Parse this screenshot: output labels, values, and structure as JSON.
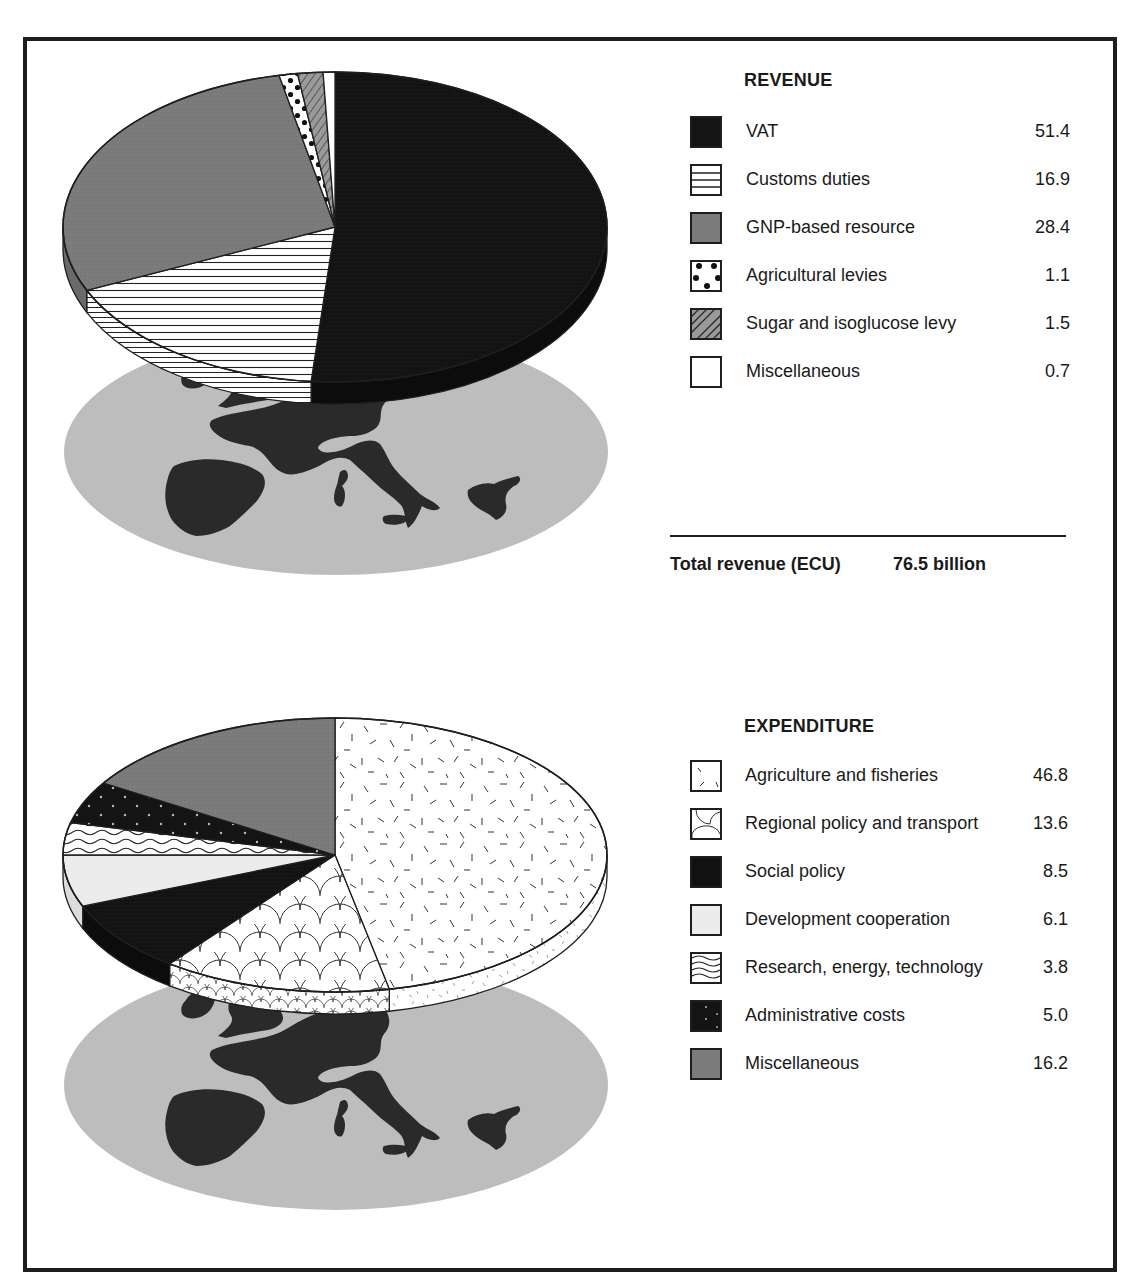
{
  "revenue": {
    "title": "REVENUE",
    "items": [
      {
        "label": "VAT",
        "value": "51.4"
      },
      {
        "label": "Customs duties",
        "value": "16.9"
      },
      {
        "label": "GNP-based resource",
        "value": "28.4"
      },
      {
        "label": "Agricultural levies",
        "value": "1.1"
      },
      {
        "label": "Sugar and isoglucose levy",
        "value": "1.5"
      },
      {
        "label": "Miscellaneous",
        "value": "0.7"
      }
    ],
    "total_label": "Total revenue (ECU)",
    "total_value": "76.5 billion"
  },
  "expenditure": {
    "title": "EXPENDITURE",
    "items": [
      {
        "label": "Agriculture and fisheries",
        "value": "46.8"
      },
      {
        "label": "Regional policy and transport",
        "value": "13.6"
      },
      {
        "label": "Social policy",
        "value": "8.5"
      },
      {
        "label": "Development cooperation",
        "value": "6.1"
      },
      {
        "label": "Research, energy, technology",
        "value": "3.8"
      },
      {
        "label": "Administrative costs",
        "value": "5.0"
      },
      {
        "label": "Miscellaneous",
        "value": "16.2"
      }
    ]
  },
  "colors": {
    "frame": "#1e1e1e",
    "black_fill": "#141414",
    "mid_grey": "#7a7a7a",
    "light_grey_fill": "#ececec",
    "map_ellipse": "#bdbdbd",
    "map_land": "#2a2a2a"
  },
  "chart_data": [
    {
      "type": "pie",
      "title": "REVENUE",
      "categories": [
        "VAT",
        "Customs duties",
        "GNP-based resource",
        "Agricultural levies",
        "Sugar and isoglucose levy",
        "Miscellaneous"
      ],
      "values": [
        51.4,
        16.9,
        28.4,
        1.1,
        1.5,
        0.7
      ],
      "patterns": [
        "solid-black",
        "horizontal-lines",
        "solid-grey",
        "dots",
        "diagonal-hatch-grey",
        "white"
      ],
      "slice_order_clockwise_from_top": [
        "VAT",
        "Customs duties",
        "GNP-based resource",
        "Agricultural levies",
        "Sugar and isoglucose levy",
        "Miscellaneous"
      ],
      "annotation": "Total revenue (ECU) 76.5 billion",
      "style": "3D pie floating above grey ellipse with map of Europe",
      "legend_position": "right"
    },
    {
      "type": "pie",
      "title": "EXPENDITURE",
      "categories": [
        "Agriculture and fisheries",
        "Regional policy and transport",
        "Social policy",
        "Development cooperation",
        "Research, energy, technology",
        "Administrative costs",
        "Miscellaneous"
      ],
      "values": [
        46.8,
        13.6,
        8.5,
        6.1,
        3.8,
        5.0,
        16.2
      ],
      "patterns": [
        "random-dashes",
        "scales",
        "solid-black",
        "light-grey",
        "waves",
        "black-with-small-marks",
        "solid-grey"
      ],
      "slice_order_clockwise_from_top": [
        "Agriculture and fisheries",
        "Regional policy and transport",
        "Social policy",
        "Development cooperation",
        "Research, energy, technology",
        "Administrative costs",
        "Miscellaneous"
      ],
      "style": "3D pie floating above grey ellipse with map of Europe",
      "legend_position": "right"
    }
  ]
}
